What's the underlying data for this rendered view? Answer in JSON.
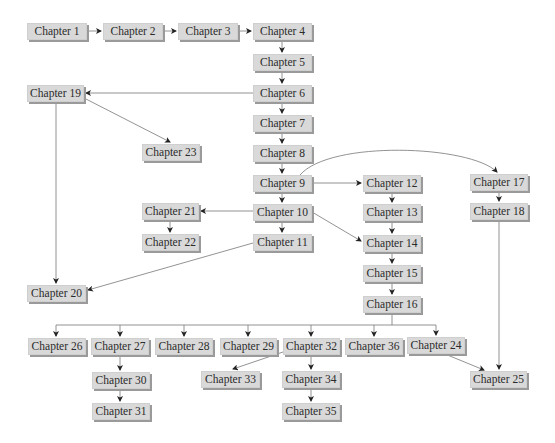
{
  "diagram": {
    "colors": {
      "box_fill": "#d9d9d9",
      "box_shadow": "#9a9a9a",
      "line": "#777777",
      "text": "#2b2b2b"
    },
    "nodes": [
      {
        "id": "c1",
        "label": "Chapter 1",
        "x": 27,
        "y": 23,
        "w": 60
      },
      {
        "id": "c2",
        "label": "Chapter 2",
        "x": 103,
        "y": 23,
        "w": 60
      },
      {
        "id": "c3",
        "label": "Chapter 3",
        "x": 178,
        "y": 23,
        "w": 60
      },
      {
        "id": "c4",
        "label": "Chapter 4",
        "x": 253,
        "y": 23,
        "w": 59
      },
      {
        "id": "c5",
        "label": "Chapter 5",
        "x": 253,
        "y": 54,
        "w": 59
      },
      {
        "id": "c6",
        "label": "Chapter 6",
        "x": 253,
        "y": 85,
        "w": 59
      },
      {
        "id": "c7",
        "label": "Chapter 7",
        "x": 253,
        "y": 115,
        "w": 59
      },
      {
        "id": "c8",
        "label": "Chapter 8",
        "x": 253,
        "y": 145,
        "w": 59
      },
      {
        "id": "c9",
        "label": "Chapter 9",
        "x": 253,
        "y": 175,
        "w": 59
      },
      {
        "id": "c10",
        "label": "Chapter 10",
        "x": 253,
        "y": 204,
        "w": 59
      },
      {
        "id": "c11",
        "label": "Chapter 11",
        "x": 253,
        "y": 234,
        "w": 59
      },
      {
        "id": "c12",
        "label": "Chapter 12",
        "x": 363,
        "y": 175,
        "w": 58
      },
      {
        "id": "c13",
        "label": "Chapter 13",
        "x": 363,
        "y": 204,
        "w": 58
      },
      {
        "id": "c14",
        "label": "Chapter 14",
        "x": 363,
        "y": 235,
        "w": 58
      },
      {
        "id": "c15",
        "label": "Chapter 15",
        "x": 363,
        "y": 265,
        "w": 58
      },
      {
        "id": "c16",
        "label": "Chapter 16",
        "x": 363,
        "y": 296,
        "w": 58
      },
      {
        "id": "c17",
        "label": "Chapter 17",
        "x": 470,
        "y": 174,
        "w": 58
      },
      {
        "id": "c18",
        "label": "Chapter 18",
        "x": 470,
        "y": 203,
        "w": 58
      },
      {
        "id": "c19",
        "label": "Chapter 19",
        "x": 27,
        "y": 85,
        "w": 57
      },
      {
        "id": "c20",
        "label": "Chapter 20",
        "x": 27,
        "y": 285,
        "w": 59
      },
      {
        "id": "c21",
        "label": "Chapter 21",
        "x": 142,
        "y": 203,
        "w": 57
      },
      {
        "id": "c22",
        "label": "Chapter 22",
        "x": 142,
        "y": 234,
        "w": 57
      },
      {
        "id": "c23",
        "label": "Chapter 23",
        "x": 142,
        "y": 144,
        "w": 58
      },
      {
        "id": "c24",
        "label": "Chapter 24",
        "x": 407,
        "y": 337,
        "w": 58
      },
      {
        "id": "c25",
        "label": "Chapter 25",
        "x": 470,
        "y": 371,
        "w": 57
      },
      {
        "id": "c26",
        "label": "Chapter 26",
        "x": 28,
        "y": 338,
        "w": 58
      },
      {
        "id": "c27",
        "label": "Chapter 27",
        "x": 91,
        "y": 338,
        "w": 58
      },
      {
        "id": "c28",
        "label": "Chapter 28",
        "x": 155,
        "y": 338,
        "w": 58
      },
      {
        "id": "c29",
        "label": "Chapter 29",
        "x": 220,
        "y": 338,
        "w": 57
      },
      {
        "id": "c30",
        "label": "Chapter 30",
        "x": 92,
        "y": 372,
        "w": 58
      },
      {
        "id": "c31",
        "label": "Chapter 31",
        "x": 92,
        "y": 403,
        "w": 58
      },
      {
        "id": "c32",
        "label": "Chapter 32",
        "x": 283,
        "y": 338,
        "w": 57
      },
      {
        "id": "c33",
        "label": "Chapter 33",
        "x": 201,
        "y": 371,
        "w": 59
      },
      {
        "id": "c34",
        "label": "Chapter 34",
        "x": 282,
        "y": 371,
        "w": 58
      },
      {
        "id": "c35",
        "label": "Chapter 35",
        "x": 282,
        "y": 403,
        "w": 58
      },
      {
        "id": "c36",
        "label": "Chapter 36",
        "x": 345,
        "y": 338,
        "w": 58
      }
    ],
    "edges": [
      {
        "d": "M87,31 L101,31",
        "arrow": true
      },
      {
        "d": "M163,31 L176,31",
        "arrow": true
      },
      {
        "d": "M238,31 L251,31",
        "arrow": true
      },
      {
        "d": "M282,40 L282,52",
        "arrow": true
      },
      {
        "d": "M282,71 L282,83",
        "arrow": true
      },
      {
        "d": "M253,93 L86,93",
        "arrow": true
      },
      {
        "d": "M282,102 L282,113",
        "arrow": true
      },
      {
        "d": "M282,132 L282,143",
        "arrow": true
      },
      {
        "d": "M282,162 L282,173",
        "arrow": true
      },
      {
        "d": "M282,192 L282,202",
        "arrow": true
      },
      {
        "d": "M282,221 L282,232",
        "arrow": true
      },
      {
        "d": "M312,183 L361,183",
        "arrow": true
      },
      {
        "d": "M300,175 C330,140 470,145 497,172",
        "arrow": true
      },
      {
        "d": "M499,191 L499,201",
        "arrow": true
      },
      {
        "d": "M499,220 L499,369",
        "arrow": true
      },
      {
        "d": "M392,192 L392,202",
        "arrow": true
      },
      {
        "d": "M392,221 L392,233",
        "arrow": true
      },
      {
        "d": "M392,252 L392,263",
        "arrow": true
      },
      {
        "d": "M392,282 L392,294",
        "arrow": true
      },
      {
        "d": "M312,212 L361,241",
        "arrow": true
      },
      {
        "d": "M253,211 L201,211",
        "arrow": true
      },
      {
        "d": "M170,220 L170,232",
        "arrow": true
      },
      {
        "d": "M84,98 L170,142",
        "arrow": true
      },
      {
        "d": "M56,102 L56,283",
        "arrow": true
      },
      {
        "d": "M253,243 L88,290",
        "arrow": true
      },
      {
        "d": "M392,313 L392,325",
        "arrow": false
      },
      {
        "d": "M56,325 L436,325",
        "arrow": false
      },
      {
        "d": "M56,325 L56,336",
        "arrow": true
      },
      {
        "d": "M120,325 L120,336",
        "arrow": true
      },
      {
        "d": "M184,325 L184,336",
        "arrow": true
      },
      {
        "d": "M248,325 L248,336",
        "arrow": true
      },
      {
        "d": "M311,325 L311,336",
        "arrow": true
      },
      {
        "d": "M374,325 L374,336",
        "arrow": true
      },
      {
        "d": "M436,325 L436,335",
        "arrow": true
      },
      {
        "d": "M120,355 L120,370",
        "arrow": true
      },
      {
        "d": "M120,389 L120,401",
        "arrow": true
      },
      {
        "d": "M311,355 L311,369",
        "arrow": true
      },
      {
        "d": "M311,388 L311,401",
        "arrow": true
      },
      {
        "d": "M283,352 L233,369",
        "arrow": true
      },
      {
        "d": "M445,354 L484,370",
        "arrow": true
      }
    ]
  }
}
